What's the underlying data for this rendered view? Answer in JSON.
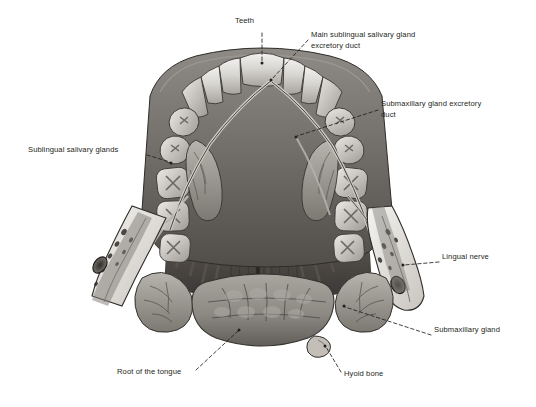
{
  "figure": {
    "background_color": "#ffffff",
    "ink_color": "#231f20",
    "leader_line_style": "dashed"
  },
  "labels": [
    {
      "id": "teeth",
      "text": "Teeth",
      "x": 235,
      "y": 22,
      "align": "left"
    },
    {
      "id": "main-sublingual-duct",
      "text": "Main sublingual salivary gland\nexcretory duct",
      "x": 311,
      "y": 36,
      "align": "left"
    },
    {
      "id": "submaxillary-duct",
      "text": "Submaxillary gland excretory\nduct",
      "x": 381,
      "y": 105,
      "align": "left"
    },
    {
      "id": "sublingual-glands",
      "text": "Sublingual salivary glands",
      "x": 28,
      "y": 151,
      "align": "left"
    },
    {
      "id": "lingual-nerve",
      "text": "Lingual nerve",
      "x": 442,
      "y": 258,
      "align": "left"
    },
    {
      "id": "submaxillary-gland",
      "text": "Submaxillary gland",
      "x": 434,
      "y": 331,
      "align": "left"
    },
    {
      "id": "root-of-tongue",
      "text": "Root of the tongue",
      "x": 117,
      "y": 373,
      "align": "left"
    },
    {
      "id": "hyoid-bone",
      "text": "Hyoid bone",
      "x": 344,
      "y": 375,
      "align": "left"
    }
  ],
  "leaders": [
    {
      "id": "leader-teeth",
      "points": "262,33 262,62",
      "dot": "262,63"
    },
    {
      "id": "leader-main-sublingual-duct",
      "points": "308,40 272,79",
      "dot": "271,80"
    },
    {
      "id": "leader-submaxillary-duct",
      "points": "378,110 297,136",
      "dot": "296,137"
    },
    {
      "id": "leader-sublingual-glands",
      "points": "147,155 170,162",
      "dot": "171,163"
    },
    {
      "id": "leader-lingual-nerve",
      "points": "439,262 404,265",
      "dot": "403,265"
    },
    {
      "id": "leader-submaxillary-gland",
      "points": "431,335 345,307",
      "dot": "344,306"
    },
    {
      "id": "leader-root-of-tongue",
      "points": "196,370 238,331",
      "dot": "239,330"
    },
    {
      "id": "leader-hyoid-bone",
      "points": "341,372 326,347",
      "dot": "325,346"
    }
  ],
  "anatomy": {
    "structures": [
      "dental-arch",
      "upper-incisors",
      "canines",
      "premolars",
      "molars",
      "cut-mandible-left",
      "cut-mandible-right",
      "genioglossus-muscle",
      "lingual-frenulum",
      "sublingual-gland-left",
      "sublingual-gland-right",
      "submandibular-gland-left",
      "submandibular-gland-right",
      "lingual-nerve-branch",
      "submandibular-duct",
      "root-of-tongue-lobules",
      "hyoid-bone-body"
    ]
  }
}
